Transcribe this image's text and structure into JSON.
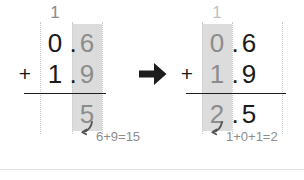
{
  "figure": {
    "kind": "column-addition-worksheet",
    "operation": "0.6 + 1.9 = 2.5",
    "step_arrow_icon": "arrow-right-icon",
    "colors": {
      "ink_dark": "#1a1a1a",
      "ink_gray": "#8c8c8c",
      "highlight_band": "#dcdcdc",
      "guide_line": "#c9c9c9",
      "divider": "#e2e2e2",
      "arrow": "#1d1d1d"
    }
  },
  "left_panel": {
    "step_label": "step-1-tenths-column",
    "carry": "1",
    "addend_1": {
      "units": "0",
      "point": ".",
      "tenths": "6"
    },
    "addend_2": {
      "units": "1",
      "point": ".",
      "tenths": "9"
    },
    "operator": "+",
    "sum": {
      "units": "",
      "point": "",
      "tenths": "5"
    },
    "annotation": "6+9=15",
    "hook_icon": "curved-hook-arrow-icon"
  },
  "right_panel": {
    "step_label": "step-2-units-column",
    "carry": "1",
    "addend_1": {
      "units": "0",
      "point": ".",
      "tenths": "6"
    },
    "addend_2": {
      "units": "1",
      "point": ".",
      "tenths": "9"
    },
    "operator": "+",
    "sum": {
      "units": "2",
      "point": ".",
      "tenths": "5"
    },
    "annotation": "1+0+1=2",
    "hook_icon": "curved-hook-arrow-icon"
  }
}
